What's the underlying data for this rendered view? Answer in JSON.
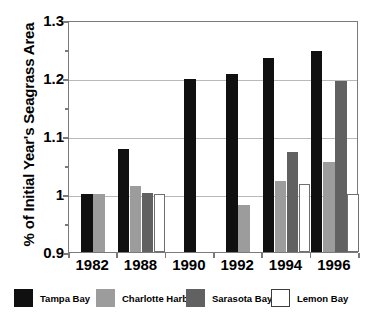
{
  "chart_data": {
    "type": "bar",
    "title": "",
    "subtitle": "",
    "xlabel": "",
    "ylabel": "% of Initial Year's Seagrass Area",
    "categories": [
      "1982",
      "1988",
      "1990",
      "1992",
      "1994",
      "1996"
    ],
    "ylim": [
      0.9,
      1.3
    ],
    "yticks": [
      "0.9",
      "1",
      "1.1",
      "1.2",
      "1.3"
    ],
    "ytick_values": [
      0.9,
      1.0,
      1.1,
      1.2,
      1.3
    ],
    "yminor_ticks": [
      0.95,
      1.05,
      1.15,
      1.25
    ],
    "grid": "horizontal",
    "gridlines": [
      1.0,
      1.1,
      1.2
    ],
    "legend_position": "bottom",
    "series": [
      {
        "name": "Tampa Bay",
        "color": "#101010",
        "values": [
          1.0,
          1.078,
          1.199,
          1.207,
          1.234,
          1.247
        ]
      },
      {
        "name": "Charlotte Harbor",
        "color": "#9c9c9c",
        "values": [
          1.0,
          1.013,
          null,
          0.981,
          1.022,
          1.056
        ]
      },
      {
        "name": "Sarasota Bay",
        "color": "#616161",
        "values": [
          null,
          1.001,
          null,
          null,
          1.072,
          1.195
        ]
      },
      {
        "name": "Lemon Bay",
        "color": "#ffffff",
        "values": [
          null,
          1.0,
          null,
          null,
          1.018,
          1.0
        ]
      }
    ]
  },
  "legend": {
    "items": [
      {
        "label": "Tampa Bay",
        "key": "tampa"
      },
      {
        "label": "Charlotte Harbor",
        "key": "charlotte"
      },
      {
        "label": "Sarasota Bay",
        "key": "sarasota"
      },
      {
        "label": "Lemon Bay",
        "key": "lemon"
      }
    ]
  }
}
